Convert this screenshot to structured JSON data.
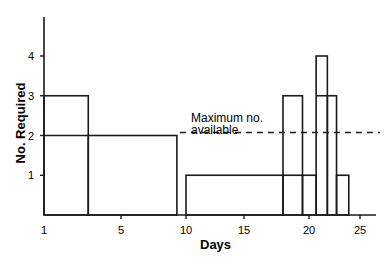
{
  "chart_data": {
    "type": "line",
    "subtype": "step",
    "title": "",
    "xlabel": "Days",
    "ylabel": "No. Required",
    "x_ticks": [
      1,
      5,
      10,
      15,
      20,
      25
    ],
    "y_ticks": [
      1,
      2,
      3,
      4
    ],
    "xlim": [
      1,
      26
    ],
    "ylim": [
      0,
      5
    ],
    "grid": false,
    "legend": null,
    "series": [
      {
        "name": "Number required",
        "segments": [
          {
            "start": 1.0,
            "end": 3.3,
            "value": 3
          },
          {
            "start": 3.3,
            "end": 9.3,
            "value": 2
          },
          {
            "start": 9.3,
            "end": 10.0,
            "value": 0
          },
          {
            "start": 10.0,
            "end": 18.0,
            "value": 1
          },
          {
            "start": 18.0,
            "end": 19.5,
            "value": 3
          },
          {
            "start": 19.5,
            "end": 20.7,
            "value": 1
          },
          {
            "start": 20.7,
            "end": 21.8,
            "value": 4
          },
          {
            "start": 21.8,
            "end": 22.7,
            "value": 3
          },
          {
            "start": 22.7,
            "end": 23.9,
            "value": 1
          }
        ]
      },
      {
        "name": "Maximum no. available",
        "style": "dashed",
        "value": 2,
        "x_range": [
          9.3,
          26
        ]
      }
    ],
    "annotations": [
      {
        "text_line1": "Maximum no.",
        "text_line2": "available",
        "x": 10.3,
        "y": 2.3
      }
    ]
  },
  "labels": {
    "xlabel": "Days",
    "ylabel": "No. Required",
    "annotation_line1": "Maximum no.",
    "annotation_line2": "available",
    "x_ticks": [
      "1",
      "5",
      "10",
      "15",
      "20",
      "25"
    ],
    "y_ticks": [
      "1",
      "2",
      "3",
      "4"
    ]
  }
}
